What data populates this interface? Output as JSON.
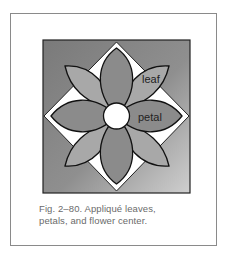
{
  "figure": {
    "labels": {
      "leaf": "leaf",
      "petal": "petal"
    },
    "colors": {
      "frame_border": "#8a8a8a",
      "square_dark": "#7d7d7d",
      "square_light": "#c4c4c4",
      "petal": "#8c8c8c",
      "leaf": "#a9a9a9",
      "diamond": "#ffffff",
      "center": "#ffffff",
      "outline": "#111111"
    }
  },
  "caption": {
    "line1": "Fig. 2–80. Appliqué leaves,",
    "line2": "petals, and flower center."
  }
}
